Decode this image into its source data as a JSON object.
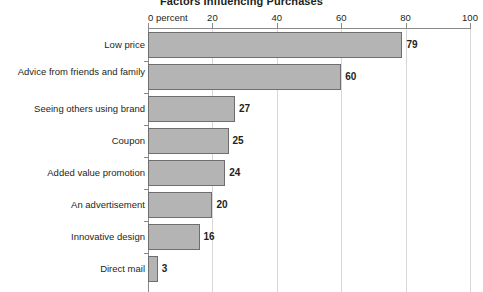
{
  "chart_data": {
    "type": "bar",
    "orientation": "horizontal",
    "title": "Factors Influencing Purchases",
    "xlabel": "",
    "ylabel": "",
    "xlim": [
      0,
      100
    ],
    "grid": true,
    "legend": null,
    "axis_first_tick_label": "0 percent",
    "tick_labels": [
      "0 percent",
      "20",
      "40",
      "60",
      "80",
      "100"
    ],
    "ticks": [
      0,
      20,
      40,
      60,
      80,
      100
    ],
    "categories": [
      "Low price",
      "Advice from friends and family",
      "Seeing others using brand",
      "Coupon",
      "Added value promotion",
      "An advertisement",
      "Innovative design",
      "Direct mail"
    ],
    "values": [
      79,
      60,
      27,
      25,
      24,
      20,
      16,
      3
    ],
    "value_labels": [
      "79",
      "60",
      "27",
      "25",
      "24",
      "20",
      "16",
      "3"
    ],
    "colors": {
      "bar_fill": "#b4b4b4",
      "bar_border": "#6e6e6e",
      "gridline": "#d7d7d7",
      "axis": "#8a8a8a",
      "text": "#231f20",
      "background": "#ffffff"
    }
  }
}
